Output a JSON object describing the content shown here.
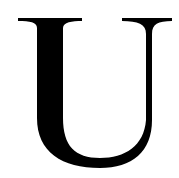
{
  "glyph": {
    "character": "U",
    "style": "serif",
    "color": "#000000",
    "background": "#ffffff"
  }
}
